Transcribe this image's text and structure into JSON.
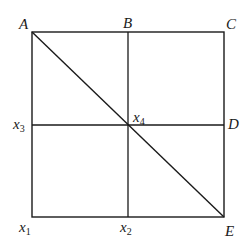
{
  "diagram": {
    "type": "square-grid-with-diagonal",
    "stroke_color": "#1a1a1a",
    "background": "#ffffff",
    "square": {
      "left": 32,
      "top": 32,
      "right": 224,
      "bottom": 217
    },
    "vertical_divider_x": 128,
    "horizontal_divider_y": 125,
    "diagonal": {
      "from": "A",
      "to": "E"
    },
    "labels": {
      "A": {
        "text": "A",
        "kind": "corner-top-left"
      },
      "B": {
        "text": "B",
        "kind": "top-midpoint"
      },
      "C": {
        "text": "C",
        "kind": "corner-top-right"
      },
      "D": {
        "text": "D",
        "kind": "right-midpoint"
      },
      "E": {
        "text": "E",
        "kind": "corner-bottom-right"
      },
      "x1": {
        "base": "x",
        "sub": "1",
        "kind": "corner-bottom-left"
      },
      "x2": {
        "base": "x",
        "sub": "2",
        "kind": "bottom-midpoint"
      },
      "x3": {
        "base": "x",
        "sub": "3",
        "kind": "left-midpoint"
      },
      "x4": {
        "base": "x",
        "sub": "4",
        "kind": "center-intersection"
      }
    }
  }
}
